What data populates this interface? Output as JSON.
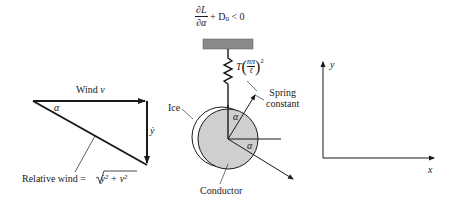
{
  "stability": {
    "condition_numerator": "∂L",
    "condition_denominator": "∂α",
    "condition_rest": "+ D",
    "condition_sub": "0",
    "condition_tail": " < 0"
  },
  "wind_triangle": {
    "wind_label": "Wind",
    "wind_symbol": "v",
    "angle_label": "α",
    "vertical_label": "ẏ",
    "relative_wind_label": "Relative wind =",
    "relative_wind_expr": "ẏ² + v²"
  },
  "conductor": {
    "spring_T": "T",
    "spring_frac_num": "nπ",
    "spring_frac_den": "ℓ",
    "spring_exp": "2",
    "spring_constant_label_1": "Spring",
    "spring_constant_label_2": "constant",
    "ice_label": "Ice",
    "conductor_label": "Conductor",
    "alpha_upper": "α",
    "alpha_lower": "α"
  },
  "axes": {
    "x_label": "x",
    "y_label": "y"
  },
  "colors": {
    "line": "#1a1a1a",
    "conductor_fill": "#cfcfcf",
    "support_fill": "#8a8a8a"
  }
}
